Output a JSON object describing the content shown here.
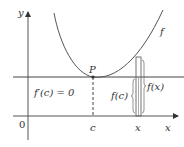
{
  "figure": {
    "axes": {
      "x_label": "x",
      "y_label": "y",
      "origin_label": "0"
    },
    "curve": {
      "label": "f"
    },
    "point": {
      "label": "P"
    },
    "tick_labels": {
      "c": "c",
      "x": "x"
    },
    "annotations": {
      "derivative": "f′(c) = 0",
      "f_c": "f(c)",
      "f_x": "f(x)"
    },
    "colors": {
      "axis": "#555555",
      "curve": "#555555",
      "tangent": "#444444",
      "text": "#333333"
    }
  }
}
